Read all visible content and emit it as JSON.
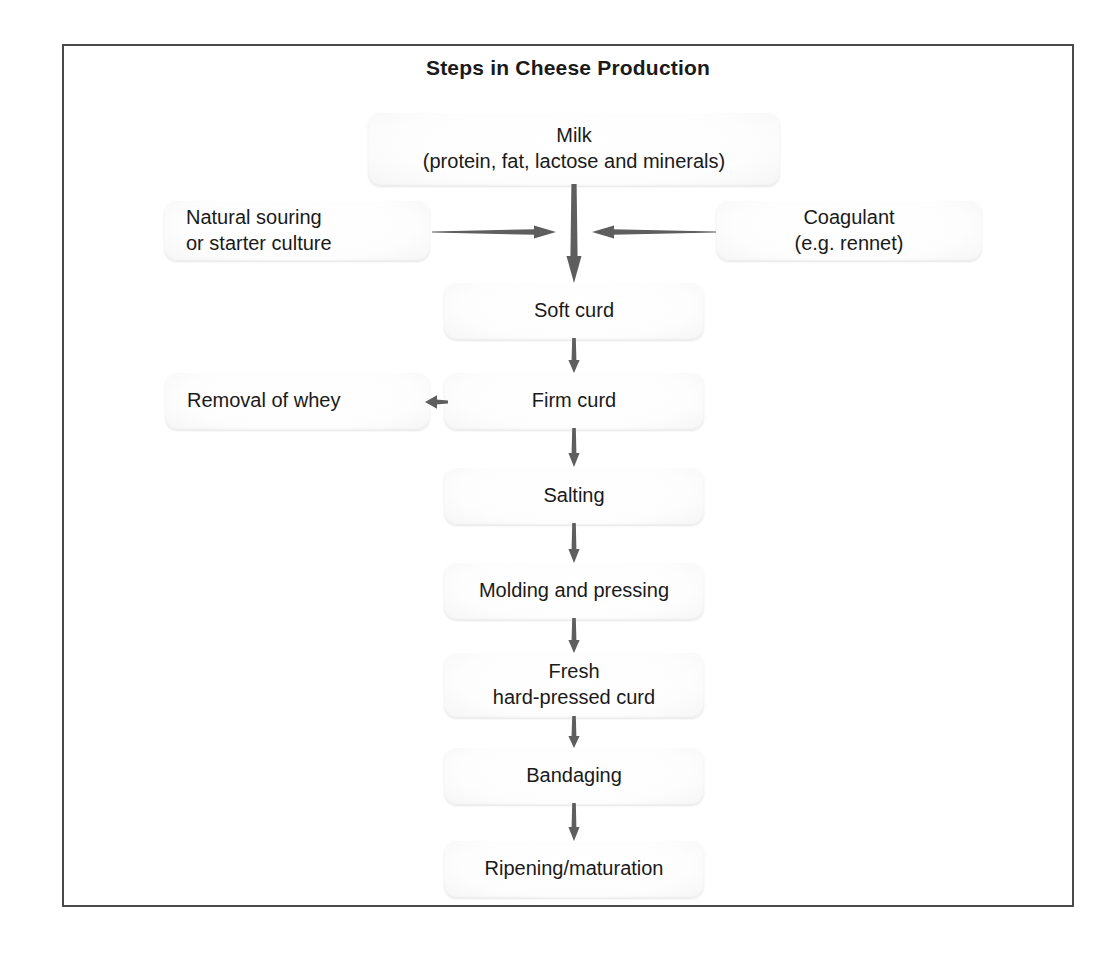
{
  "diagram": {
    "title": "Steps in Cheese Production",
    "border_color": "#4a4a4a",
    "arrow_color": "#5a5a5a",
    "node_fill": "#f2f2f2",
    "text_color": "#1a1a1a"
  },
  "nodes": {
    "milk": {
      "label": "Milk\n(protein, fat, lactose and minerals)"
    },
    "natural_souring": {
      "label": "Natural souring\nor starter culture"
    },
    "coagulant": {
      "label": "Coagulant\n(e.g. rennet)"
    },
    "soft_curd": {
      "label": "Soft curd"
    },
    "firm_curd": {
      "label": "Firm curd"
    },
    "removal_of_whey": {
      "label": "Removal of whey"
    },
    "salting": {
      "label": "Salting"
    },
    "molding_and_pressing": {
      "label": "Molding and pressing"
    },
    "fresh_hard_pressed_curd": {
      "label": "Fresh\nhard-pressed curd"
    },
    "bandaging": {
      "label": "Bandaging"
    },
    "ripening_maturation": {
      "label": "Ripening/maturation"
    }
  },
  "flow": {
    "steps": [
      "Milk (protein, fat, lactose and minerals)",
      "Soft curd",
      "Firm curd",
      "Salting",
      "Molding and pressing",
      "Fresh hard-pressed curd",
      "Bandaging",
      "Ripening/maturation"
    ],
    "inputs": [
      "Natural souring or starter culture",
      "Coagulant (e.g. rennet)"
    ],
    "outputs": [
      "Removal of whey"
    ]
  },
  "arrows": {
    "milk_to_soft_curd": "down",
    "souring_to_junction": "right",
    "coagulant_to_junction": "left",
    "soft_to_firm": "down",
    "firm_to_whey": "left",
    "firm_to_salting": "down",
    "salting_to_molding": "down",
    "molding_to_fresh": "down",
    "fresh_to_bandaging": "down",
    "bandaging_to_ripening": "down"
  }
}
